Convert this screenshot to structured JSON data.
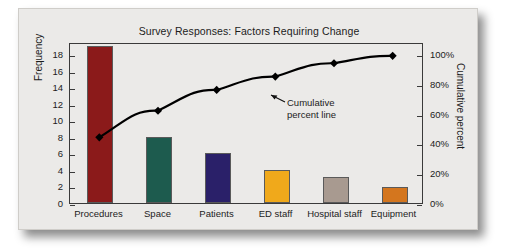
{
  "card": {
    "background_color": "#ebeae8",
    "border_color": "#cfcdc9"
  },
  "annotation": {
    "line1": "Cumulative",
    "line2": "percent line"
  },
  "chart_data": {
    "type": "bar",
    "title": "Survey Responses: Factors Requiring Change",
    "xlabel": "",
    "ylabel": "Frequency",
    "y2label": "Cumulative percent",
    "grid": false,
    "legend": "none",
    "categories": [
      "Procedures",
      "Space",
      "Patients",
      "ED staff",
      "Hospital staff",
      "Equipment"
    ],
    "values": [
      19,
      8,
      6,
      4,
      3.2,
      2
    ],
    "bar_colors": [
      "#8b1a1a",
      "#1d5b4e",
      "#2a2069",
      "#f0a91b",
      "#a89a90",
      "#d4761e"
    ],
    "ylim": [
      0,
      19.5
    ],
    "yticks": [
      0,
      2,
      4,
      6,
      8,
      10,
      12,
      14,
      16,
      18
    ],
    "ytick_labels": [
      "0",
      "2",
      "4",
      "6",
      "8",
      "10",
      "12",
      "14",
      "16",
      "18"
    ],
    "y2lim": [
      0,
      108
    ],
    "y2ticks": [
      0,
      20,
      40,
      60,
      80,
      100
    ],
    "y2tick_labels": [
      "0%",
      "20%",
      "40%",
      "60%",
      "80%",
      "100%"
    ],
    "series": [
      {
        "name": "Frequency",
        "kind": "bar",
        "values": [
          19,
          8,
          6,
          4,
          3.2,
          2
        ]
      },
      {
        "name": "Cumulative percent line",
        "kind": "line",
        "marker": "diamond",
        "color": "#000000",
        "values": [
          45,
          63,
          77,
          86,
          95,
          100
        ]
      }
    ]
  }
}
